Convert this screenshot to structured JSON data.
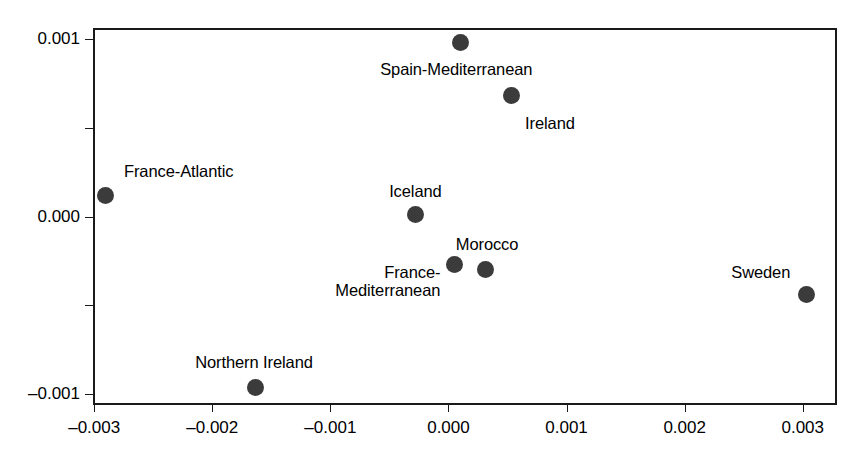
{
  "chart_data": {
    "type": "scatter",
    "title": "",
    "subtitle": "",
    "xlabel": "",
    "ylabel": "",
    "xlim": [
      -0.00301,
      0.00329
    ],
    "ylim": [
      -0.00106,
      0.00106
    ],
    "grid": false,
    "legend": null,
    "marker_color": "#3b3b3b",
    "axis_color": "#1a1a1a",
    "xticks": [
      -0.003,
      -0.002,
      -0.001,
      0.0,
      0.001,
      0.002,
      0.003
    ],
    "xticklabels": [
      "–0.003",
      "–0.002",
      "–0.001",
      "0.000",
      "0.001",
      "0.002",
      "0.003"
    ],
    "yticks": [
      -0.001,
      -0.0005,
      0.0,
      0.0005,
      0.001
    ],
    "yticklabels": [
      "–0.001",
      "",
      "0.000",
      "",
      "0.001"
    ],
    "points": [
      {
        "label": "Spain-Mediterranean",
        "x": 0.0001,
        "y": 0.00098,
        "label_dx": -4,
        "label_dy": 18,
        "label_align": "center"
      },
      {
        "label": "Ireland",
        "x": 0.00053,
        "y": 0.00068,
        "label_dx": 14,
        "label_dy": 18,
        "label_align": "left"
      },
      {
        "label": "France-Atlantic",
        "x": -0.0029,
        "y": 0.00012,
        "label_dx": 18,
        "label_dy": -33,
        "label_align": "left"
      },
      {
        "label": "Iceland",
        "x": -0.00028,
        "y": 1e-05,
        "label_dx": 0,
        "label_dy": -33,
        "label_align": "center"
      },
      {
        "label": "France-\nMediterranean",
        "x": 5e-05,
        "y": -0.00027,
        "label_dx": -14,
        "label_dy": -2,
        "label_align": "right"
      },
      {
        "label": "Morocco",
        "x": 0.00031,
        "y": -0.0003,
        "label_dx": 2,
        "label_dy": -35,
        "label_align": "center"
      },
      {
        "label": "Sweden",
        "x": 0.00303,
        "y": -0.00044,
        "label_dx": -16,
        "label_dy": -32,
        "label_align": "right"
      },
      {
        "label": "Northern Ireland",
        "x": -0.00163,
        "y": -0.00096,
        "label_dx": -2,
        "label_dy": -34,
        "label_align": "center"
      }
    ]
  }
}
